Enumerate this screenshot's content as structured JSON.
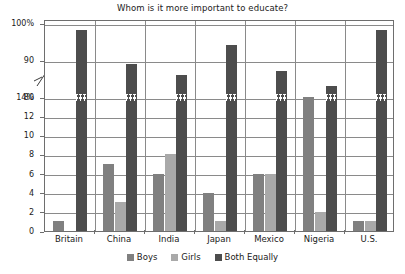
{
  "chart_data": {
    "type": "bar",
    "title": "Whom is it more important to educate?",
    "xlabel": "",
    "ylabel": "",
    "categories": [
      "Britain",
      "China",
      "India",
      "Japan",
      "Mexico",
      "Nigeria",
      "U.S."
    ],
    "series": [
      {
        "name": "Boys",
        "color": "#808080",
        "values": [
          1,
          7,
          6,
          4,
          6,
          14,
          1
        ]
      },
      {
        "name": "Girls",
        "color": "#a9a9a9",
        "values": [
          0,
          3,
          8,
          1,
          6,
          2,
          1
        ]
      },
      {
        "name": "Both Equally",
        "color": "#4d4d4d",
        "values": [
          98,
          89,
          86,
          94,
          87,
          83,
          98
        ]
      }
    ],
    "grid": true,
    "legend_position": "bottom",
    "broken_axis": true,
    "y_lower_range": [
      0,
      14
    ],
    "y_upper_range": [
      80,
      100
    ],
    "y_ticks": [
      {
        "label": "100%",
        "value": 100
      },
      {
        "label": "90",
        "value": 90
      },
      {
        "label": "80",
        "value": 80
      },
      {
        "label": "14%",
        "value": 14
      },
      {
        "label": "12",
        "value": 12
      },
      {
        "label": "10",
        "value": 10
      },
      {
        "label": "8",
        "value": 8
      },
      {
        "label": "6",
        "value": 6
      },
      {
        "label": "4",
        "value": 4
      },
      {
        "label": "2",
        "value": 2
      },
      {
        "label": "0",
        "value": 0
      }
    ]
  },
  "legend": {
    "items": [
      {
        "label": "Boys"
      },
      {
        "label": "Girls"
      },
      {
        "label": "Both Equally"
      }
    ]
  }
}
